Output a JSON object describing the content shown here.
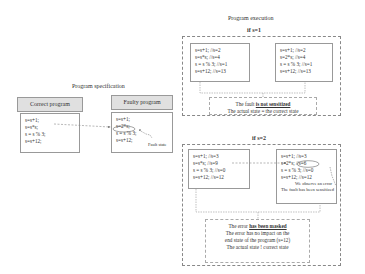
{
  "spec": {
    "title": "Program specification",
    "correct": {
      "header": "Correct program",
      "lines": [
        "s=s+1;",
        "s=s*s;",
        "s = s % 3;",
        "s=s+12;"
      ]
    },
    "faulty": {
      "header": "Faulty program",
      "lines": [
        "s=s+1;",
        "s=2*s;",
        "s = s % 3;",
        "s=s+12;"
      ],
      "fault_label": "Fault state"
    }
  },
  "execution": {
    "title": "Program execution",
    "case1": {
      "label": "if s=1",
      "correct_lines": [
        "s=s+1;   //s=2",
        "s=s*s;   //s=4",
        "s = s % 3;  //s=1",
        "s=s+12; //s=13"
      ],
      "faulty_lines": [
        "s=s+1;    //s=2",
        "s=2*s;    //s=4",
        "s = s % 3;  //s=1",
        "s=s+12;  //s=13"
      ],
      "note_line1_prefix": "The fault ",
      "note_line1_emph": "is not sensitized",
      "note_line2": "The actual state = the correct state"
    },
    "case2": {
      "label": "if s=2",
      "correct_lines": [
        "s=s+1;   //s=3",
        "s=s*s;   //s=9",
        "s = s % 3;  //s=0",
        "s=s+12; //s=12"
      ],
      "faulty_lines": [
        "s=s+1;    //s=3",
        "s=2*s;    //s=6",
        "s = s % 3;  //s=0",
        "s=s+12;  //s=12"
      ],
      "observe_line1": "We observe an error",
      "observe_line2": "The fault has been sensitized",
      "note_line1_prefix": "The error ",
      "note_line1_emph": "has been masked",
      "note_line2": "The error has no impact on the",
      "note_line3": "end state of the program (s=12)",
      "note_line4": "The actual state ! correct state"
    }
  }
}
